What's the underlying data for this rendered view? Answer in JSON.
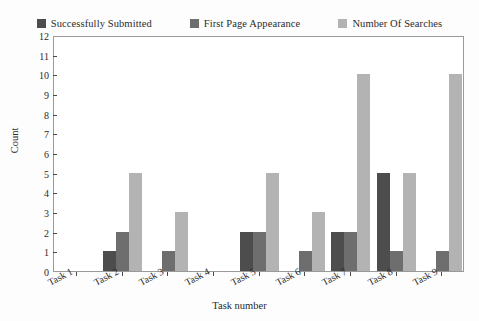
{
  "chart_data": {
    "type": "bar",
    "title": "",
    "xlabel": "Task number",
    "ylabel": "Count",
    "categories": [
      "Task 1",
      "Task 2",
      "Task 3",
      "Task 4",
      "Task 5",
      "Task 6",
      "Task 7",
      "Task 8",
      "Task 9"
    ],
    "series": [
      {
        "name": "Successfully Submitted",
        "color": "#4d4d4d",
        "values": [
          0,
          1,
          0,
          0,
          2,
          0,
          2,
          5,
          0
        ]
      },
      {
        "name": "First Page Appearance",
        "color": "#6e6e6e",
        "values": [
          0,
          2,
          1,
          0,
          2,
          1,
          2,
          1,
          1
        ]
      },
      {
        "name": "Number Of Searches",
        "color": "#b3b3b3",
        "values": [
          0,
          5,
          3,
          0,
          5,
          3,
          10,
          5,
          10
        ]
      }
    ],
    "ylim": [
      0,
      12
    ],
    "yticks": [
      0,
      1,
      2,
      3,
      4,
      5,
      6,
      7,
      8,
      9,
      10,
      11,
      12
    ],
    "grid": false,
    "legend_position": "top",
    "xtick_rotation": -28
  },
  "legend": {
    "items": [
      {
        "label": "Successfully Submitted",
        "color": "#4d4d4d",
        "swatch_name": "legend-swatch-successfully-submitted"
      },
      {
        "label": "First Page Appearance",
        "color": "#6e6e6e",
        "swatch_name": "legend-swatch-first-page-appearance"
      },
      {
        "label": "Number Of Searches",
        "color": "#b3b3b3",
        "swatch_name": "legend-swatch-number-of-searches"
      }
    ]
  },
  "axes": {
    "y_label": "Count",
    "x_label": "Task number"
  }
}
